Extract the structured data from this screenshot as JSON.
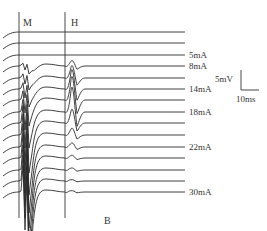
{
  "chart_data": {
    "type": "line",
    "title": "",
    "panel_label": "B",
    "markers": [
      {
        "label": "M",
        "x_px": 19
      },
      {
        "label": "H",
        "x_px": 65
      }
    ],
    "scale_bar": {
      "vertical": "5mV",
      "horizontal": "10ms"
    },
    "traces": [
      {
        "baseline_y": 32,
        "label": "",
        "m_amp": 0,
        "h_amp": 0
      },
      {
        "baseline_y": 43,
        "label": "",
        "m_amp": 0,
        "h_amp": 0
      },
      {
        "baseline_y": 55,
        "label": "5mA",
        "m_amp": 0,
        "h_amp": 0
      },
      {
        "baseline_y": 66,
        "label": "8mA",
        "m_amp": 8,
        "h_amp": 8
      },
      {
        "baseline_y": 78,
        "label": "",
        "m_amp": 12,
        "h_amp": 18
      },
      {
        "baseline_y": 89,
        "label": "14mA",
        "m_amp": 18,
        "h_amp": 28
      },
      {
        "baseline_y": 100,
        "label": "",
        "m_amp": 26,
        "h_amp": 34
      },
      {
        "baseline_y": 112,
        "label": "18mA",
        "m_amp": 36,
        "h_amp": 36
      },
      {
        "baseline_y": 123,
        "label": "",
        "m_amp": 50,
        "h_amp": 20
      },
      {
        "baseline_y": 135,
        "label": "",
        "m_amp": 60,
        "h_amp": 10
      },
      {
        "baseline_y": 147,
        "label": "22mA",
        "m_amp": 66,
        "h_amp": 6
      },
      {
        "baseline_y": 158,
        "label": "",
        "m_amp": 70,
        "h_amp": 4
      },
      {
        "baseline_y": 170,
        "label": "",
        "m_amp": 72,
        "h_amp": 3
      },
      {
        "baseline_y": 181,
        "label": "",
        "m_amp": 74,
        "h_amp": 2
      },
      {
        "baseline_y": 192,
        "label": "30mA",
        "m_amp": 76,
        "h_amp": 2
      }
    ],
    "stimulus_labels": [
      "5mA",
      "8mA",
      "14mA",
      "18mA",
      "22mA",
      "30mA"
    ],
    "xlabel": "",
    "ylabel": ""
  }
}
